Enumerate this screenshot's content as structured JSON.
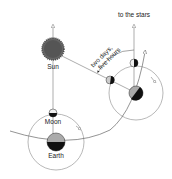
{
  "labels": {
    "sun": "Sun",
    "moon": "Moon",
    "earth": "Earth",
    "to_stars": "to the stars",
    "duration_line1": "two days,",
    "duration_line2": "five hours"
  },
  "colors": {
    "line": "#777777",
    "sun": "#555555",
    "dark": "#111111",
    "light": "#bbbbbb"
  }
}
